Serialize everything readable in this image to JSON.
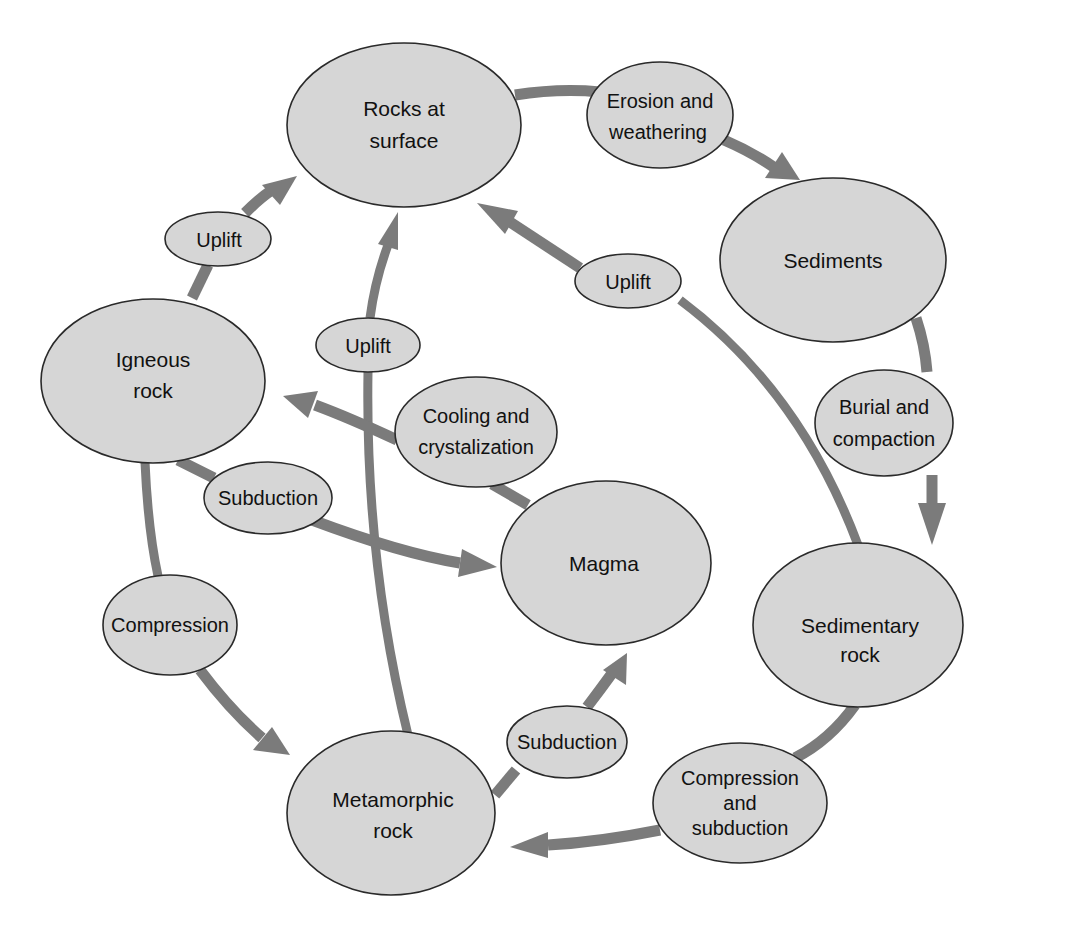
{
  "diagram": {
    "colors": {
      "node_fill": "#d6d6d6",
      "node_stroke": "#2a2a2a",
      "arrow": "#7b7b7b",
      "text": "#111111",
      "background": "#ffffff"
    },
    "nodes": {
      "rocks_at_surface": {
        "line1": "Rocks at",
        "line2": "surface"
      },
      "sediments": {
        "line1": "Sediments"
      },
      "sedimentary_rock": {
        "line1": "Sedimentary",
        "line2": "rock"
      },
      "metamorphic_rock": {
        "line1": "Metamorphic",
        "line2": "rock"
      },
      "magma": {
        "line1": "Magma"
      },
      "igneous_rock": {
        "line1": "Igneous",
        "line2": "rock"
      }
    },
    "processes": {
      "erosion": {
        "line1": "Erosion and",
        "line2": "weathering"
      },
      "burial": {
        "line1": "Burial and",
        "line2": "compaction"
      },
      "compression_subduction": {
        "line1": "Compression",
        "line2": "and",
        "line3": "subduction"
      },
      "subduction_bottom": {
        "line1": "Subduction"
      },
      "cooling": {
        "line1": "Cooling and",
        "line2": "crystalization"
      },
      "subduction_left": {
        "line1": "Subduction"
      },
      "compression": {
        "line1": "Compression"
      },
      "uplift_left": {
        "line1": "Uplift"
      },
      "uplift_center": {
        "line1": "Uplift"
      },
      "uplift_right": {
        "line1": "Uplift"
      }
    },
    "edges": [
      {
        "from": "Rocks at surface",
        "via": "Erosion and weathering",
        "to": "Sediments"
      },
      {
        "from": "Sediments",
        "via": "Burial and compaction",
        "to": "Sedimentary rock"
      },
      {
        "from": "Sedimentary rock",
        "via": "Compression and subduction",
        "to": "Metamorphic rock"
      },
      {
        "from": "Sedimentary rock",
        "via": "Uplift",
        "to": "Rocks at surface"
      },
      {
        "from": "Metamorphic rock",
        "via": "Subduction",
        "to": "Magma"
      },
      {
        "from": "Metamorphic rock",
        "via": "Uplift",
        "to": "Rocks at surface"
      },
      {
        "from": "Magma",
        "via": "Cooling and crystalization",
        "to": "Igneous rock"
      },
      {
        "from": "Igneous rock",
        "via": "Subduction",
        "to": "Magma"
      },
      {
        "from": "Igneous rock",
        "via": "Compression",
        "to": "Metamorphic rock"
      },
      {
        "from": "Igneous rock",
        "via": "Uplift",
        "to": "Rocks at surface"
      }
    ]
  }
}
